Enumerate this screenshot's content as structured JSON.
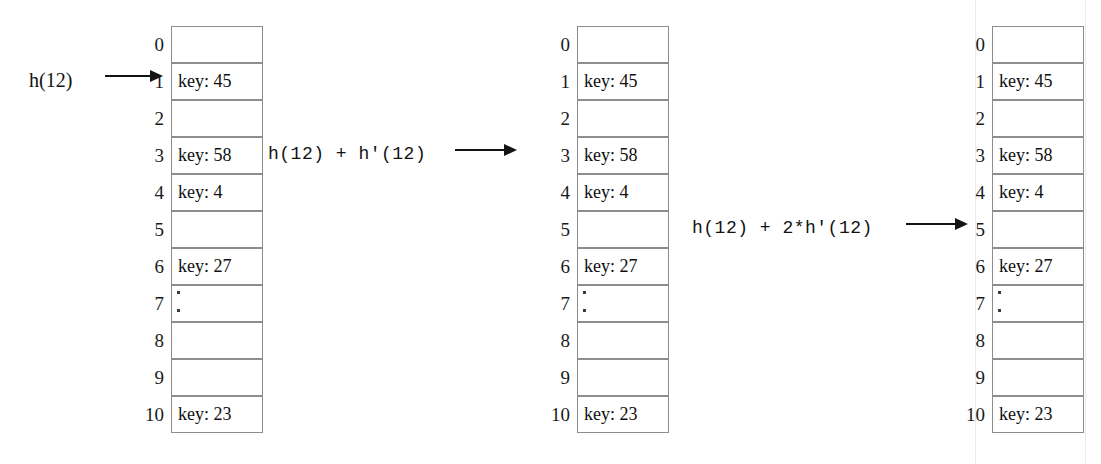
{
  "diagram": {
    "slot_count": 11,
    "colors": {
      "border": "#8d8d8d",
      "text": "#111111",
      "arrow": "#141414",
      "background": "#ffffff"
    }
  },
  "slot_indices": [
    "0",
    "1",
    "2",
    "3",
    "4",
    "5",
    "6",
    "7",
    "8",
    "9",
    "10"
  ],
  "table_contents": [
    "",
    "key: 45",
    "",
    "key: 58",
    "key: 4",
    "",
    "key: 27",
    "dots",
    "",
    "",
    "key: 23"
  ],
  "tables": [
    {
      "name": "first-probe-table",
      "left": 171
    },
    {
      "name": "second-probe-table",
      "left": 577
    },
    {
      "name": "third-probe-table",
      "left": 992
    }
  ],
  "probes": [
    {
      "name": "probe-1",
      "label": "h(12)",
      "style": "serif",
      "target_slot": "1"
    },
    {
      "name": "probe-2",
      "label": "h(12) + h'(12)",
      "style": "mono",
      "target_slot": "3"
    },
    {
      "name": "probe-3",
      "label": "h(12) + 2*h'(12)",
      "style": "mono",
      "target_slot": "5"
    }
  ]
}
